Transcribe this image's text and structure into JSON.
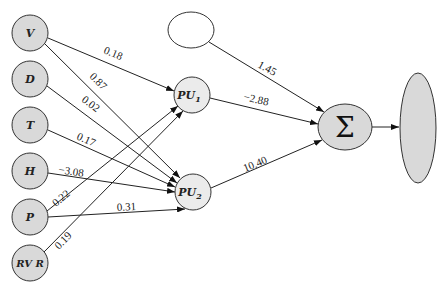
{
  "inputs": [
    {
      "id": "V",
      "label": "V",
      "cx": 30,
      "cy": 33
    },
    {
      "id": "D",
      "label": "D",
      "cx": 30,
      "cy": 79
    },
    {
      "id": "T",
      "label": "T",
      "cx": 30,
      "cy": 125
    },
    {
      "id": "H",
      "label": "H",
      "cx": 30,
      "cy": 171
    },
    {
      "id": "P",
      "label": "P",
      "cx": 30,
      "cy": 217
    },
    {
      "id": "RVR",
      "label": "RV R",
      "cx": 30,
      "cy": 263
    }
  ],
  "hidden": [
    {
      "id": "PU1",
      "label": "PU",
      "sub": "1",
      "cx": 192,
      "cy": 95
    },
    {
      "id": "PU2",
      "label": "PU",
      "sub": "2",
      "cx": 193,
      "cy": 192
    }
  ],
  "bias": {
    "cx": 191,
    "cy": 30
  },
  "sum": {
    "label": "Σ",
    "cx": 345,
    "cy": 127
  },
  "output": {
    "cx": 418,
    "cy": 128
  },
  "weights": {
    "V_PU1": "0.18",
    "V_PU2": "0.87",
    "D_PU2": "0.02",
    "T_PU2": "0.17",
    "H_PU2": "−3.08",
    "P_PU1": "0.22",
    "P_PU2": "0.31",
    "RVR_PU1": "0.19",
    "bias_sum": "1.45",
    "PU1_sum": "−2.88",
    "PU2_sum": "10.40"
  }
}
